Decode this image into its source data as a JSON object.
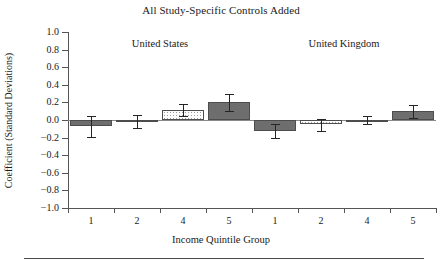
{
  "chart_data": {
    "type": "bar",
    "title": "All Study-Specific Controls Added",
    "xlabel": "Income Quintile Group",
    "ylabel": "Coefficient (Standard Deviations)",
    "ylim": [
      -1.0,
      1.0
    ],
    "ytick_labels": [
      "1.0",
      "0.8",
      "0.6",
      "0.4",
      "0.2",
      "0.0",
      "−0.2",
      "−0.4",
      "−0.6",
      "−0.8",
      "−1.0"
    ],
    "ytick_values": [
      1.0,
      0.8,
      0.6,
      0.4,
      0.2,
      0.0,
      -0.2,
      -0.4,
      -0.6,
      -0.8,
      -1.0
    ],
    "grid": false,
    "legend": "none",
    "groups": [
      {
        "name": "United States",
        "label": "United States"
      },
      {
        "name": "United Kingdom",
        "label": "United Kingdom"
      }
    ],
    "categories": [
      "1",
      "2",
      "4",
      "5",
      "1",
      "2",
      "4",
      "5"
    ],
    "values": [
      -0.07,
      -0.01,
      0.11,
      0.2,
      -0.13,
      -0.05,
      -0.01,
      0.1
    ],
    "errors_low": [
      -0.19,
      -0.09,
      0.04,
      0.1,
      -0.21,
      -0.12,
      -0.05,
      0.02
    ],
    "errors_high": [
      0.04,
      0.06,
      0.18,
      0.29,
      -0.04,
      0.01,
      0.05,
      0.17
    ],
    "bars": [
      {
        "group": "United States",
        "category": "1",
        "value": -0.07,
        "ci_low": -0.19,
        "ci_high": 0.04,
        "fill": "solid"
      },
      {
        "group": "United States",
        "category": "2",
        "value": -0.01,
        "ci_low": -0.09,
        "ci_high": 0.06,
        "fill": "solid"
      },
      {
        "group": "United States",
        "category": "4",
        "value": 0.11,
        "ci_low": 0.04,
        "ci_high": 0.18,
        "fill": "dotted"
      },
      {
        "group": "United States",
        "category": "5",
        "value": 0.2,
        "ci_low": 0.1,
        "ci_high": 0.29,
        "fill": "solid"
      },
      {
        "group": "United Kingdom",
        "category": "1",
        "value": -0.13,
        "ci_low": -0.21,
        "ci_high": -0.04,
        "fill": "solid"
      },
      {
        "group": "United Kingdom",
        "category": "2",
        "value": -0.05,
        "ci_low": -0.12,
        "ci_high": 0.01,
        "fill": "dotted"
      },
      {
        "group": "United Kingdom",
        "category": "4",
        "value": -0.01,
        "ci_low": -0.05,
        "ci_high": 0.05,
        "fill": "solid"
      },
      {
        "group": "United Kingdom",
        "category": "5",
        "value": 0.1,
        "ci_low": 0.02,
        "ci_high": 0.17,
        "fill": "solid"
      }
    ],
    "colors": {
      "bar_solid": "#6e6e6e",
      "bar_dotted": "#fdfdfd",
      "bar_outline": "#4d4d4d",
      "axis": "#555555",
      "zero_line": "#8a8a8a",
      "error_bar": "#242424",
      "background": "#ffffff"
    }
  }
}
